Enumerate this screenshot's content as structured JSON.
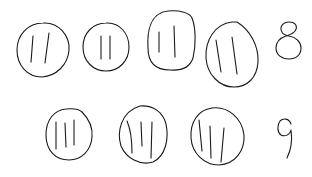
{
  "diagram": {
    "stroke_color": "#1a1a1a",
    "background": "#ffffff",
    "rows": [
      {
        "groups": [
          {
            "tallies": 2,
            "cx": 43,
            "cy": 50,
            "rx": 26,
            "ry": 27
          },
          {
            "tallies": 2,
            "cx": 106,
            "cy": 47,
            "rx": 23,
            "ry": 24
          },
          {
            "tallies": 2,
            "cx": 171,
            "cy": 41,
            "rx": 24,
            "ry": 30
          },
          {
            "tallies": 2,
            "cx": 232,
            "cy": 55,
            "rx": 26,
            "ry": 32
          }
        ],
        "total": "8",
        "total_label": "8"
      },
      {
        "groups": [
          {
            "tallies": 3,
            "cx": 69,
            "cy": 134,
            "rx": 23,
            "ry": 26
          },
          {
            "tallies": 3,
            "cx": 143,
            "cy": 135,
            "rx": 24,
            "ry": 29
          },
          {
            "tallies": 3,
            "cx": 218,
            "cy": 136,
            "rx": 26,
            "ry": 29
          }
        ],
        "total": "9",
        "total_label": "9"
      }
    ]
  }
}
